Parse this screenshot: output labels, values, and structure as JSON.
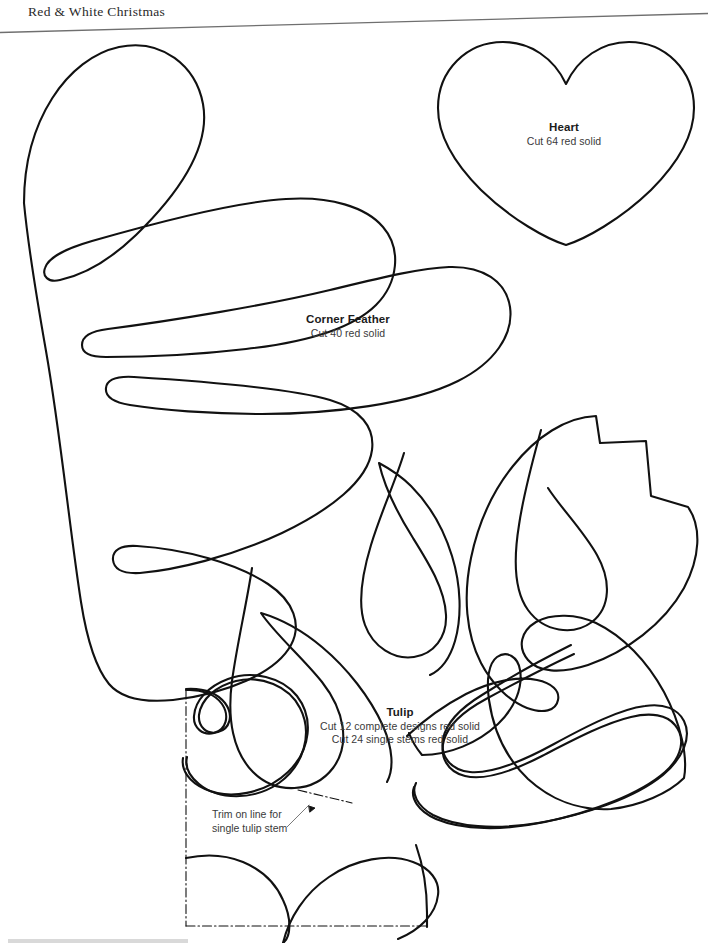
{
  "page": {
    "running_head": "Red & White Christmas",
    "background_color": "#ffffff",
    "ink_color": "#111111",
    "rule_color": "#6f6f6f"
  },
  "patterns": [
    {
      "id": "heart",
      "title": "Heart",
      "lines": [
        "Cut 64 red solid"
      ]
    },
    {
      "id": "corner-feather",
      "title": "Corner Feather",
      "lines": [
        "Cut 40 red solid"
      ]
    },
    {
      "id": "tulip",
      "title": "Tulip",
      "lines": [
        "Cut 12 complete designs red solid",
        "Cut 24 single stems red solid"
      ]
    }
  ],
  "callout": {
    "line1": "Trim on line for",
    "line2": "single tulip stem"
  }
}
